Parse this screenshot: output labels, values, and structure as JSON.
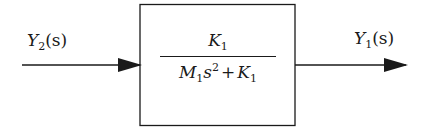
{
  "diagram": {
    "type": "block-diagram",
    "input": {
      "symbol": "Y",
      "subscript": "2",
      "arg": "(s)"
    },
    "output": {
      "symbol": "Y",
      "subscript": "1",
      "arg": "(s)"
    },
    "block": {
      "transfer_function": "K1 / (M1 s^2 + K1)",
      "numerator": {
        "symbol": "K",
        "subscript": "1"
      },
      "denominator": {
        "term1": {
          "symbol": "M",
          "subscript": "1",
          "var": "s",
          "power": "2"
        },
        "operator": "+",
        "term2": {
          "symbol": "K",
          "subscript": "1"
        }
      }
    }
  }
}
